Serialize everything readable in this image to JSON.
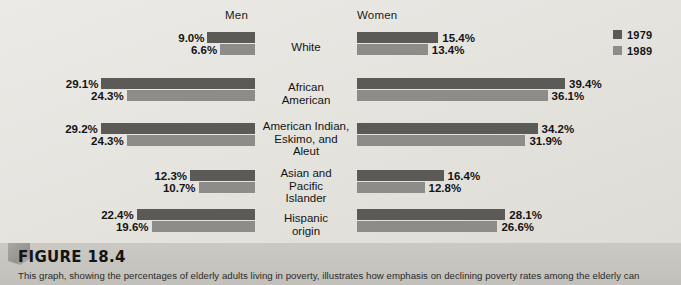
{
  "figure": {
    "title": "FIGURE 18.4",
    "caption": "This graph, showing the percentages of elderly adults living in poverty, illustrates how emphasis on declining poverty rates among the elderly can"
  },
  "headers": {
    "men": "Men",
    "women": "Women"
  },
  "legend": [
    {
      "label": "1979",
      "color": "#5c5a57"
    },
    {
      "label": "1989",
      "color": "#8e8c88"
    }
  ],
  "colors": {
    "series_1979": "#5c5a57",
    "series_1989": "#8e8c88",
    "panel_background": "#e7e5e0",
    "caption_background": "#c6c4bf",
    "text": "#141414"
  },
  "chart_data": {
    "type": "bar",
    "title": "FIGURE 18.4",
    "subtitle": "Percentages of elderly adults living in poverty",
    "orientation": "horizontal-bidirectional",
    "xlabel": "",
    "ylabel": "",
    "grid": false,
    "legend_position": "top-right",
    "axis_note": "Men's bars extend leftward from a shared center baseline; Women's bars extend rightward.",
    "xlim": [
      0,
      40
    ],
    "categories": [
      "White",
      "African American",
      "American Indian, Eskimo, and Aleut",
      "Asian and Pacific Islander",
      "Hispanic origin"
    ],
    "panels": [
      {
        "name": "Men",
        "direction": "left",
        "series": [
          {
            "name": "1979",
            "values": [
              9.0,
              29.1,
              29.2,
              12.3,
              22.4
            ]
          },
          {
            "name": "1989",
            "values": [
              6.6,
              24.3,
              24.3,
              10.7,
              19.6
            ]
          }
        ]
      },
      {
        "name": "Women",
        "direction": "right",
        "series": [
          {
            "name": "1979",
            "values": [
              15.4,
              39.4,
              34.2,
              16.4,
              28.1
            ]
          },
          {
            "name": "1989",
            "values": [
              13.4,
              36.1,
              31.9,
              12.8,
              26.6
            ]
          }
        ]
      }
    ]
  },
  "rows": [
    {
      "label": "White",
      "men": {
        "v1979": "9.0%",
        "v1989": "6.6%",
        "n1979": 9.0,
        "n1989": 6.6
      },
      "women": {
        "v1979": "15.4%",
        "v1989": "13.4%",
        "n1979": 15.4,
        "n1989": 13.4
      }
    },
    {
      "label": "African\nAmerican",
      "men": {
        "v1979": "29.1%",
        "v1989": "24.3%",
        "n1979": 29.1,
        "n1989": 24.3
      },
      "women": {
        "v1979": "39.4%",
        "v1989": "36.1%",
        "n1979": 39.4,
        "n1989": 36.1
      }
    },
    {
      "label": "American Indian,\nEskimo, and\nAleut",
      "men": {
        "v1979": "29.2%",
        "v1989": "24.3%",
        "n1979": 29.2,
        "n1989": 24.3
      },
      "women": {
        "v1979": "34.2%",
        "v1989": "31.9%",
        "n1979": 34.2,
        "n1989": 31.9
      }
    },
    {
      "label": "Asian and\nPacific\nIslander",
      "men": {
        "v1979": "12.3%",
        "v1989": "10.7%",
        "n1979": 12.3,
        "n1989": 10.7
      },
      "women": {
        "v1979": "16.4%",
        "v1989": "12.8%",
        "n1979": 16.4,
        "n1989": 12.8
      }
    },
    {
      "label": "Hispanic\norigin",
      "men": {
        "v1979": "22.4%",
        "v1989": "19.6%",
        "n1979": 22.4,
        "n1989": 19.6
      },
      "women": {
        "v1979": "28.1%",
        "v1989": "26.6%",
        "n1979": 28.1,
        "n1989": 26.6
      }
    }
  ]
}
